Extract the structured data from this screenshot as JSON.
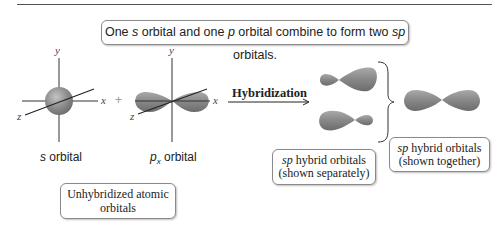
{
  "header": {
    "caption_parts": [
      "One ",
      "s",
      " orbital and one ",
      "p",
      " orbital combine to form two ",
      "sp",
      " orbitals."
    ]
  },
  "left_diagram": {
    "s_orbital": {
      "axes": {
        "x": "x",
        "y": "y",
        "z": "z"
      },
      "label_italic": "s",
      "label_rest": " orbital"
    },
    "plus_sign": "+",
    "px_orbital": {
      "axes": {
        "x": "x",
        "y": "y",
        "z": "z"
      },
      "label_italic": "p",
      "label_sub": "x",
      "label_rest": " orbital"
    },
    "group_caption_line1": "Unhybridized atomic",
    "group_caption_line2": "orbitals"
  },
  "arrow": {
    "label": "Hybridization"
  },
  "right_diagram": {
    "separate_caption_italic": "sp",
    "separate_caption_line1_rest": " hybrid orbitals",
    "separate_caption_line2": "(shown separately)",
    "together_caption_italic": "sp",
    "together_caption_line1_rest": " hybrid orbitals",
    "together_caption_line2": "(shown together)"
  },
  "colors": {
    "orbital_fill": "#8c8c8c",
    "orbital_highlight": "#b5b5b5",
    "axis": "#333333",
    "box_border": "#8a8a8a"
  }
}
